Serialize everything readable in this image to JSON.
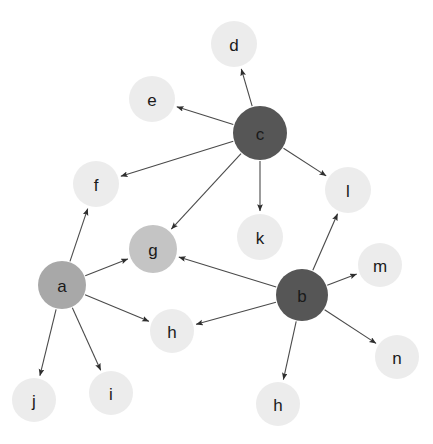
{
  "diagram": {
    "background_color": "#ffffff",
    "edge_color": "#4a4a4a",
    "label_color": "#1a1a1a",
    "node_colors": {
      "dark": "#565656",
      "medium": "#a8a8a8",
      "medium_light": "#c4c4c4",
      "light": "#ececec"
    },
    "nodes": [
      {
        "id": "d",
        "label": "d",
        "x": 234,
        "y": 44,
        "r": 23,
        "shade": "light",
        "color": "#ececec"
      },
      {
        "id": "e",
        "label": "e",
        "x": 152,
        "y": 99,
        "r": 23,
        "shade": "light",
        "color": "#ececec"
      },
      {
        "id": "c",
        "label": "c",
        "x": 260,
        "y": 133,
        "r": 27,
        "shade": "dark",
        "color": "#565656"
      },
      {
        "id": "f",
        "label": "f",
        "x": 96,
        "y": 184,
        "r": 23,
        "shade": "light",
        "color": "#ececec"
      },
      {
        "id": "l",
        "label": "l",
        "x": 348,
        "y": 190,
        "r": 23,
        "shade": "light",
        "color": "#ececec"
      },
      {
        "id": "k",
        "label": "k",
        "x": 260,
        "y": 237,
        "r": 23,
        "shade": "light",
        "color": "#ececec"
      },
      {
        "id": "g",
        "label": "g",
        "x": 153,
        "y": 249,
        "r": 24,
        "shade": "medium_light",
        "color": "#c4c4c4"
      },
      {
        "id": "m",
        "label": "m",
        "x": 380,
        "y": 265,
        "r": 22,
        "shade": "light",
        "color": "#ececec"
      },
      {
        "id": "a",
        "label": "a",
        "x": 62,
        "y": 285,
        "r": 24,
        "shade": "medium",
        "color": "#a8a8a8"
      },
      {
        "id": "b",
        "label": "b",
        "x": 302,
        "y": 295,
        "r": 26,
        "shade": "dark",
        "color": "#565656"
      },
      {
        "id": "h1",
        "label": "h",
        "x": 172,
        "y": 331,
        "r": 22,
        "shade": "light",
        "color": "#ececec"
      },
      {
        "id": "n",
        "label": "n",
        "x": 397,
        "y": 357,
        "r": 22,
        "shade": "light",
        "color": "#ececec"
      },
      {
        "id": "i",
        "label": "i",
        "x": 111,
        "y": 393,
        "r": 22,
        "shade": "light",
        "color": "#ececec"
      },
      {
        "id": "j",
        "label": "j",
        "x": 34,
        "y": 400,
        "r": 22,
        "shade": "light",
        "color": "#ececec"
      },
      {
        "id": "h2",
        "label": "h",
        "x": 278,
        "y": 404,
        "r": 22,
        "shade": "light",
        "color": "#ececec"
      }
    ],
    "edges": [
      {
        "source": "c",
        "target": "d",
        "directed": true
      },
      {
        "source": "c",
        "target": "e",
        "directed": true
      },
      {
        "source": "c",
        "target": "f",
        "directed": true
      },
      {
        "source": "c",
        "target": "g",
        "directed": true
      },
      {
        "source": "c",
        "target": "k",
        "directed": true
      },
      {
        "source": "c",
        "target": "l",
        "directed": true
      },
      {
        "source": "a",
        "target": "f",
        "directed": true
      },
      {
        "source": "a",
        "target": "g",
        "directed": true
      },
      {
        "source": "a",
        "target": "h1",
        "directed": true
      },
      {
        "source": "a",
        "target": "i",
        "directed": true
      },
      {
        "source": "a",
        "target": "j",
        "directed": true
      },
      {
        "source": "b",
        "target": "g",
        "directed": true
      },
      {
        "source": "b",
        "target": "h1",
        "directed": true
      },
      {
        "source": "b",
        "target": "l",
        "directed": true
      },
      {
        "source": "b",
        "target": "m",
        "directed": true
      },
      {
        "source": "b",
        "target": "n",
        "directed": true
      },
      {
        "source": "b",
        "target": "h2",
        "directed": true
      }
    ]
  }
}
